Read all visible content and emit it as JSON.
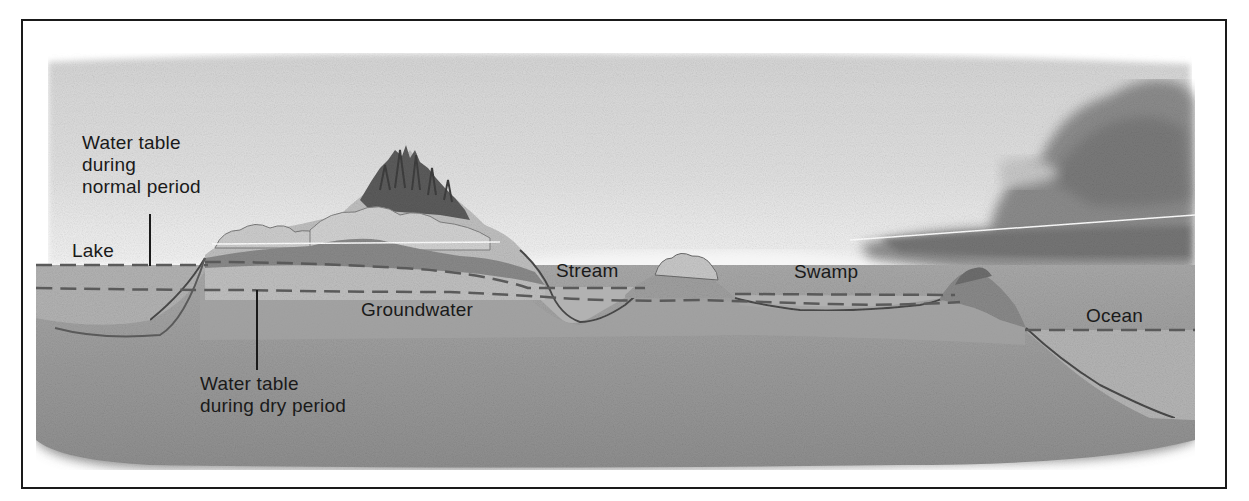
{
  "figure": {
    "colors": {
      "sky": "#d9d9d9",
      "sky_light": "#ececec",
      "cloud": "#8f8f8f",
      "cloud_dark": "#777777",
      "ground": "#9a9a9a",
      "ground_deep": "#8a8a8a",
      "saturated": "#a8a8a8",
      "water": "#b1b1b1",
      "hill": "#bdbdbd",
      "forest": "#5e5e5e",
      "outline": "#4a4a4a",
      "text": "#1a1a1a",
      "border": "#1a1a1a"
    },
    "labels": {
      "water_table_normal": [
        "Water table",
        "during",
        "normal period"
      ],
      "lake": "Lake",
      "stream": "Stream",
      "swamp": "Swamp",
      "ocean": "Ocean",
      "groundwater": "Groundwater",
      "water_table_dry": [
        "Water table",
        "during dry period"
      ]
    }
  }
}
